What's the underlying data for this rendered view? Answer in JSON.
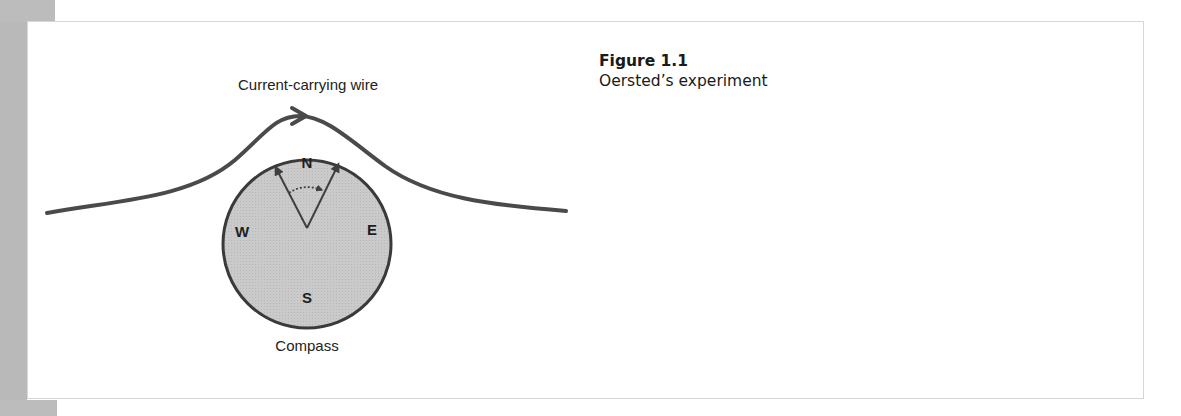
{
  "figure": {
    "number_label": "Figure 1.1",
    "title": "Oersted’s experiment",
    "diagram": {
      "wire_label": "Current-carrying wire",
      "compass_label": "Compass",
      "compass_directions": {
        "north": "N",
        "south": "S",
        "east": "E",
        "west": "W"
      },
      "icons": [
        "wire-current-arrow-icon",
        "compass-needle-original-icon",
        "compass-needle-deflected-icon",
        "deflection-arc-arrow-icon"
      ]
    }
  },
  "colors": {
    "margin_gray": "#b9b9b9",
    "compass_fill": "#c8c8c8",
    "stroke_dark": "#4a4a4a",
    "box_border": "#d6d6d6"
  }
}
